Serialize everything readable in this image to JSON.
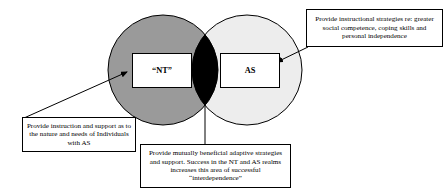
{
  "diagram": {
    "type": "venn-two-set",
    "colors": {
      "left_circle_fill": "#9a9a9a",
      "right_circle_fill": "#ededed",
      "intersection_fill": "#000000",
      "stroke": "#000000",
      "background": "#ffffff",
      "text": "#000000"
    },
    "sets": {
      "left": {
        "label": "“NT”",
        "fill": "#9a9a9a"
      },
      "right": {
        "label": "AS",
        "fill": "#ededed"
      },
      "intersection": {
        "label": "",
        "fill": "#000000"
      }
    },
    "callouts": [
      {
        "id": "nt-support",
        "text": "Provide instruction and support as to the nature and needs of Individuals with AS",
        "points_to": "left-set",
        "connector": "arrow"
      },
      {
        "id": "as-strategies",
        "text": "Provide instructional strategies re: greater social competence, coping skills and personal independence",
        "points_to": "right-set",
        "connector": "arrow"
      },
      {
        "id": "interdependence",
        "text": "Provide mutually beneficial adaptive strategies and support. Success in the NT and AS realms increases this area of successful “interdependence”",
        "points_to": "intersection",
        "connector": "line"
      }
    ]
  }
}
